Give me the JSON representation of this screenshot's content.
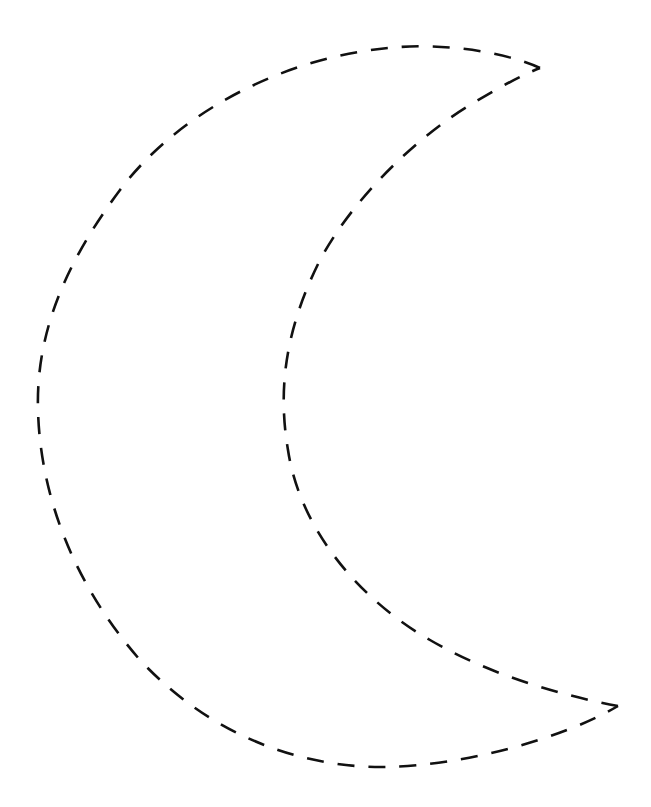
{
  "figure": {
    "style": "dashed outline template",
    "background_color": "#ffffff",
    "stroke_color": "#111111",
    "stroke_width": 2.6,
    "dash_pattern": "17 14",
    "tips": {
      "top": [
        540,
        68
      ],
      "bottom": [
        618,
        706
      ]
    },
    "outer_path": "M 540 68 C 500 50, 440 44, 400 47 C 290 54, 180 110, 120 190 C 60 270, 36 340, 38 410 C 40 490, 70 580, 140 660 C 210 735, 300 768, 385 767 C 460 766, 560 740, 618 706",
    "inner_path": "M 618 706 C 560 695, 490 675, 430 640 C 360 600, 300 530, 288 450 C 276 380, 290 320, 320 260 C 355 195, 420 135, 470 105 C 500 87, 520 76, 540 68"
  }
}
